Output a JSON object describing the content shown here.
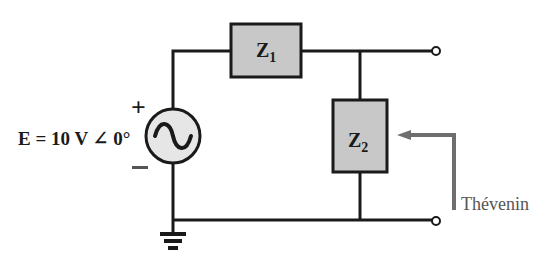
{
  "diagram": {
    "type": "circuit",
    "source": {
      "label": "E = 10 V ∠ 0°",
      "plus": "+",
      "minus": "−",
      "kind": "ac-voltage-source"
    },
    "components": [
      {
        "id": "Z1",
        "letter": "Z",
        "sub": "1",
        "position": "series-top"
      },
      {
        "id": "Z2",
        "letter": "Z",
        "sub": "2",
        "position": "shunt"
      }
    ],
    "arrow_label": "Thévenin",
    "terminals": 2,
    "ground": true
  },
  "colors": {
    "wire": "#1a1a1a",
    "box_fill": "#c8c8c8",
    "source_fill": "#e6e6e6",
    "arrow": "#6e6e6e"
  }
}
